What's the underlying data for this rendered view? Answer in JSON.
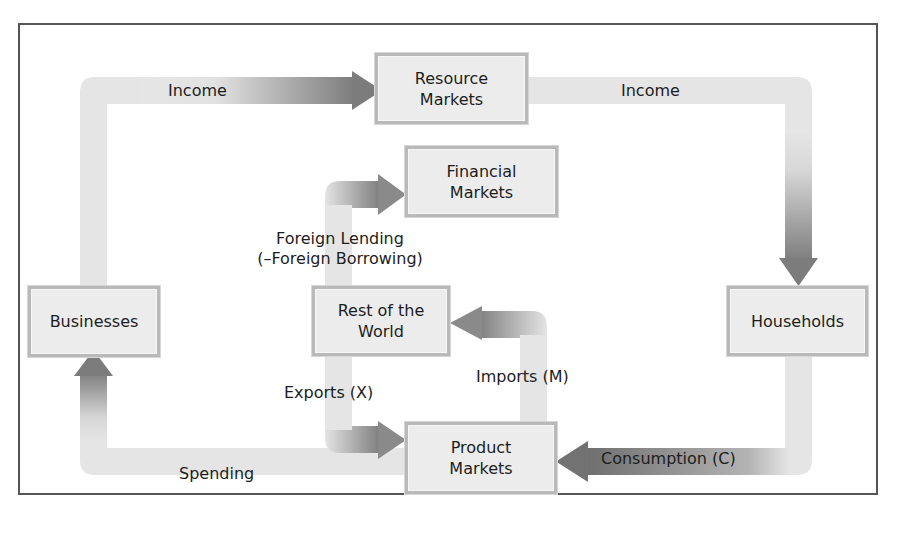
{
  "diagram": {
    "type": "circular-flow",
    "nodes": {
      "resource_markets": {
        "line1": "Resource",
        "line2": "Markets"
      },
      "financial_markets": {
        "line1": "Financial",
        "line2": "Markets"
      },
      "businesses": {
        "line1": "Businesses"
      },
      "rest_of_world": {
        "line1": "Rest of the",
        "line2": "World"
      },
      "households": {
        "line1": "Households"
      },
      "product_markets": {
        "line1": "Product",
        "line2": "Markets"
      }
    },
    "flows": {
      "income_left": "Income",
      "income_right": "Income",
      "foreign_lending_line1": "Foreign Lending",
      "foreign_lending_line2": "(–Foreign Borrowing)",
      "exports": "Exports (X)",
      "imports": "Imports (M)",
      "spending": "Spending",
      "consumption": "Consumption (C)"
    },
    "edges": [
      {
        "from": "Businesses",
        "to": "Resource Markets",
        "label": "Income"
      },
      {
        "from": "Resource Markets",
        "to": "Households",
        "label": "Income"
      },
      {
        "from": "Households",
        "to": "Product Markets",
        "label": "Consumption (C)"
      },
      {
        "from": "Product Markets",
        "to": "Businesses",
        "label": "Spending"
      },
      {
        "from": "Rest of the World",
        "to": "Financial Markets",
        "label": "Foreign Lending (–Foreign Borrowing)"
      },
      {
        "from": "Rest of the World",
        "to": "Product Markets",
        "label": "Exports (X)"
      },
      {
        "from": "Product Markets",
        "to": "Rest of the World",
        "label": "Imports (M)"
      }
    ],
    "colors": {
      "band_light": "#e4e4e4",
      "arrow_dark": "#7a7a7a",
      "box_fill": "#ececec",
      "box_border": "#b9b9b9",
      "frame": "#555555"
    }
  }
}
